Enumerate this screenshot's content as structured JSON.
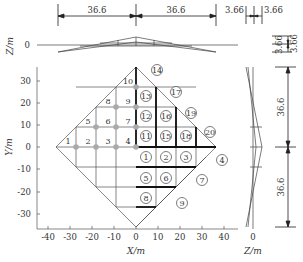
{
  "diagram": {
    "type": "grid-shell plan with elevations",
    "plan": {
      "x_axis_label": "X/m",
      "y_axis_label": "Y/m",
      "x_ticks": [
        "-40",
        "-30",
        "-20",
        "-10",
        "0",
        "10",
        "20",
        "30",
        "40"
      ],
      "y_ticks": [
        "30",
        "20",
        "10",
        "0",
        "-10",
        "-20",
        "-30"
      ],
      "plain_labels": [
        {
          "id": "1",
          "text": "1"
        },
        {
          "id": "2",
          "text": "2"
        },
        {
          "id": "3",
          "text": "3"
        },
        {
          "id": "4",
          "text": "4"
        },
        {
          "id": "5",
          "text": "5"
        },
        {
          "id": "6",
          "text": "6"
        },
        {
          "id": "7",
          "text": "7"
        },
        {
          "id": "8",
          "text": "8"
        },
        {
          "id": "9",
          "text": "9"
        },
        {
          "id": "10",
          "text": "10"
        }
      ],
      "circled_labels": [
        {
          "text": "1"
        },
        {
          "text": "2"
        },
        {
          "text": "3"
        },
        {
          "text": "4"
        },
        {
          "text": "5"
        },
        {
          "text": "6"
        },
        {
          "text": "7"
        },
        {
          "text": "8"
        },
        {
          "text": "9"
        },
        {
          "text": "11"
        },
        {
          "text": "12"
        },
        {
          "text": "13"
        },
        {
          "text": "14"
        },
        {
          "text": "15"
        },
        {
          "text": "16"
        },
        {
          "text": "17"
        },
        {
          "text": "18"
        },
        {
          "text": "19"
        },
        {
          "text": "20"
        }
      ]
    },
    "top_elevation": {
      "axis_label": "Z/m",
      "zero_tick": "0",
      "dims": [
        "36.6",
        "36.6",
        "3.66",
        "3.66"
      ]
    },
    "right_elevation": {
      "axis_label": "Z/m",
      "zero_tick": "0",
      "dims": [
        "3.66",
        "3.66",
        "36.6",
        "36.6"
      ]
    }
  }
}
